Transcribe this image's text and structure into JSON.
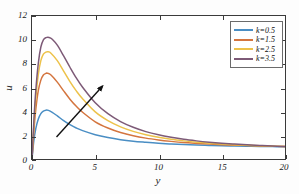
{
  "chart_data": {
    "type": "line",
    "title": "",
    "xlabel": "y",
    "ylabel": "u",
    "xlim": [
      0,
      20
    ],
    "ylim": [
      0,
      12
    ],
    "xticks": [
      0,
      5,
      10,
      15,
      20
    ],
    "yticks": [
      0,
      2,
      4,
      6,
      8,
      10,
      12
    ],
    "grid": false,
    "legend_position": "top-right",
    "annotation": {
      "type": "arrow",
      "label": "increasing k",
      "from": [
        2.0,
        1.9
      ],
      "to": [
        5.6,
        6.1
      ]
    },
    "series": [
      {
        "name": "k=0.5",
        "color": "#4A8EC4",
        "peak_x": 1.1,
        "peak_y": 4.1,
        "asymptote": 1.0,
        "x": [
          0,
          0.15,
          0.3,
          0.5,
          0.7,
          0.9,
          1.1,
          1.3,
          1.6,
          2.0,
          2.5,
          3.0,
          3.5,
          4.0,
          5.0,
          6.0,
          7.0,
          8.0,
          9.0,
          10.0,
          11.0,
          12.0,
          13.0,
          14.0,
          15.0,
          16.0,
          17.0,
          18.0,
          19.0,
          20.0
        ],
        "y": [
          0,
          1.55,
          2.55,
          3.35,
          3.8,
          4.02,
          4.1,
          4.08,
          3.92,
          3.62,
          3.22,
          2.88,
          2.6,
          2.38,
          2.04,
          1.8,
          1.62,
          1.49,
          1.4,
          1.32,
          1.26,
          1.21,
          1.17,
          1.14,
          1.11,
          1.09,
          1.07,
          1.05,
          1.04,
          1.02
        ]
      },
      {
        "name": "k=1.5",
        "color": "#D4753F",
        "peak_x": 1.2,
        "peak_y": 7.2,
        "asymptote": 1.0,
        "x": [
          0,
          0.15,
          0.3,
          0.5,
          0.7,
          0.9,
          1.1,
          1.2,
          1.5,
          2.0,
          2.5,
          3.0,
          3.5,
          4.0,
          5.0,
          6.0,
          7.0,
          8.0,
          9.0,
          10.0,
          11.0,
          12.0,
          13.0,
          14.0,
          15.0,
          16.0,
          17.0,
          18.0,
          19.0,
          20.0
        ],
        "y": [
          0,
          2.4,
          4.15,
          5.75,
          6.62,
          7.05,
          7.18,
          7.2,
          7.05,
          6.45,
          5.72,
          5.02,
          4.42,
          3.92,
          3.12,
          2.6,
          2.22,
          1.95,
          1.75,
          1.6,
          1.48,
          1.38,
          1.31,
          1.25,
          1.2,
          1.16,
          1.13,
          1.1,
          1.07,
          1.04
        ]
      },
      {
        "name": "k=2.5",
        "color": "#EDC24A",
        "peak_x": 1.25,
        "peak_y": 9.0,
        "asymptote": 1.0,
        "x": [
          0,
          0.15,
          0.3,
          0.5,
          0.7,
          0.9,
          1.1,
          1.25,
          1.5,
          2.0,
          2.5,
          3.0,
          3.5,
          4.0,
          5.0,
          6.0,
          7.0,
          8.0,
          9.0,
          10.0,
          11.0,
          12.0,
          13.0,
          14.0,
          15.0,
          16.0,
          17.0,
          18.0,
          19.0,
          20.0
        ],
        "y": [
          0,
          2.9,
          5.1,
          7.1,
          8.25,
          8.8,
          8.97,
          9.0,
          8.88,
          8.25,
          7.38,
          6.5,
          5.72,
          5.05,
          3.95,
          3.22,
          2.7,
          2.32,
          2.04,
          1.82,
          1.65,
          1.52,
          1.41,
          1.33,
          1.26,
          1.2,
          1.16,
          1.12,
          1.08,
          1.05
        ]
      },
      {
        "name": "k=3.5",
        "color": "#7D5A77",
        "peak_x": 1.35,
        "peak_y": 10.2,
        "asymptote": 1.0,
        "x": [
          0,
          0.15,
          0.3,
          0.5,
          0.7,
          0.9,
          1.1,
          1.35,
          1.6,
          2.0,
          2.5,
          3.0,
          3.5,
          4.0,
          5.0,
          6.0,
          7.0,
          8.0,
          9.0,
          10.0,
          11.0,
          12.0,
          13.0,
          14.0,
          15.0,
          16.0,
          17.0,
          18.0,
          19.0,
          20.0
        ],
        "y": [
          0,
          3.25,
          5.75,
          8.05,
          9.4,
          10.0,
          10.18,
          10.2,
          10.05,
          9.55,
          8.65,
          7.7,
          6.8,
          6.02,
          4.72,
          3.8,
          3.14,
          2.66,
          2.3,
          2.03,
          1.82,
          1.65,
          1.52,
          1.41,
          1.32,
          1.25,
          1.19,
          1.14,
          1.09,
          1.05
        ]
      }
    ]
  },
  "axes": {
    "xticklabels": [
      "0",
      "5",
      "10",
      "15",
      "20"
    ],
    "yticklabels": [
      "0",
      "2",
      "4",
      "6",
      "8",
      "10",
      "12"
    ],
    "xlabel": "y",
    "ylabel": "u"
  },
  "legend": {
    "items": [
      {
        "label": "k=0.5",
        "color": "#4A8EC4"
      },
      {
        "label": "k=1.5",
        "color": "#D4753F"
      },
      {
        "label": "k=2.5",
        "color": "#EDC24A"
      },
      {
        "label": "k=3.5",
        "color": "#7D5A77"
      }
    ]
  }
}
